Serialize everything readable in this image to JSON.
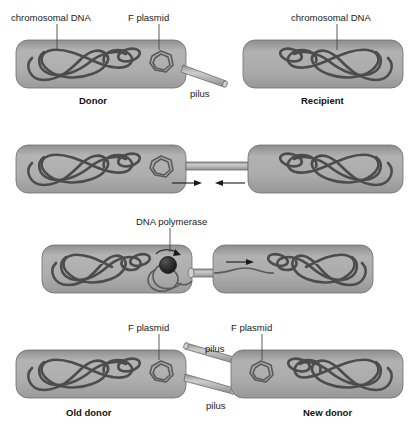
{
  "figure": {
    "width": 414,
    "height": 431,
    "background": "#ffffff"
  },
  "palette": {
    "cell_fill_light": "#b9b9b9",
    "cell_fill_mid": "#a2a2a2",
    "cell_fill_dark": "#8f8f8f",
    "cell_stroke": "#6f6f6f",
    "dna_stroke": "#4c4c4c",
    "plasmid_stroke": "#5a5a5a",
    "pilus_light": "#c3c3c3",
    "pilus_dark": "#8a8a8a",
    "polymerase_fill": "#2b2b2b",
    "text": "#1a1a1a",
    "leader": "#4a4a4a"
  },
  "panels": [
    {
      "id": "panel-1",
      "step": 1,
      "description": "Donor cell with F plasmid and pilus; separate recipient cell",
      "labels": {
        "donor_chromosome": "chromosomal DNA",
        "f_plasmid": "F plasmid",
        "pilus": "pilus",
        "donor_caption": "Donor",
        "recipient_chromosome": "chromosomal DNA",
        "recipient_caption": "Recipient"
      }
    },
    {
      "id": "panel-2",
      "step": 2,
      "description": "Pilus bridges donor and recipient; cells drawn together",
      "labels": {}
    },
    {
      "id": "panel-3",
      "step": 3,
      "description": "Rolling-circle replication: DNA polymerase copies F plasmid, single strand transferred through bridge",
      "labels": {
        "dna_polymerase": "DNA polymerase"
      }
    },
    {
      "id": "panel-4",
      "step": 4,
      "description": "Both cells now carry an F plasmid and a pilus; both are donors",
      "labels": {
        "old_donor_plasmid": "F plasmid",
        "new_donor_plasmid": "F plasmid",
        "pilus_upper": "pilus",
        "pilus_lower": "pilus",
        "old_donor_caption": "Old donor",
        "new_donor_caption": "New donor"
      }
    }
  ]
}
